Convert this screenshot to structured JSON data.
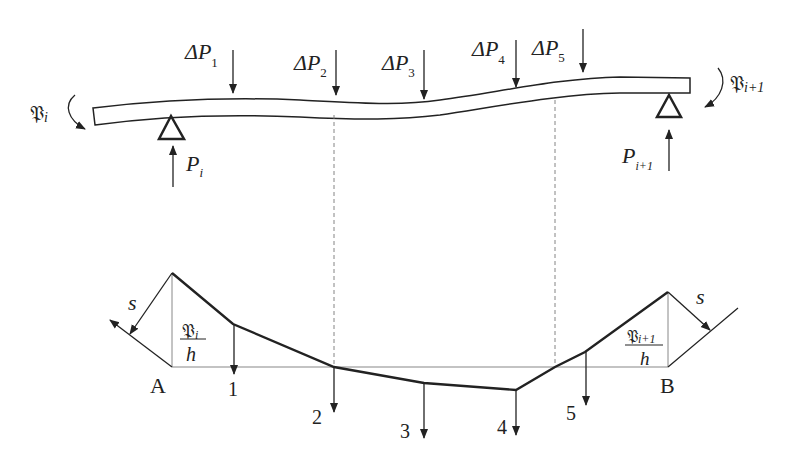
{
  "figure": {
    "beam": {
      "left_moment_label": "𝔓",
      "left_moment_sub": "i",
      "right_moment_label": "𝔓",
      "right_moment_sub": "i+1",
      "left_reaction_label": "P",
      "left_reaction_sub": "i",
      "right_reaction_label": "P",
      "right_reaction_sub": "i+1",
      "loads": [
        {
          "label": "ΔP",
          "sub": "1"
        },
        {
          "label": "ΔP",
          "sub": "2"
        },
        {
          "label": "ΔP",
          "sub": "3"
        },
        {
          "label": "ΔP",
          "sub": "4"
        },
        {
          "label": "ΔP",
          "sub": "5"
        }
      ]
    },
    "funicular": {
      "left_point": "A",
      "right_point": "B",
      "left_force_label": "s",
      "right_force_label": "s",
      "left_ratio_num": "𝔓",
      "left_ratio_num_sub": "i",
      "left_ratio_den": "h",
      "right_ratio_num": "𝔓",
      "right_ratio_num_sub": "i+1",
      "right_ratio_den": "h",
      "markers": [
        "1",
        "2",
        "3",
        "4",
        "5"
      ]
    },
    "colors": {
      "ink": "#222222",
      "guide": "#888888",
      "background": "#ffffff"
    }
  }
}
